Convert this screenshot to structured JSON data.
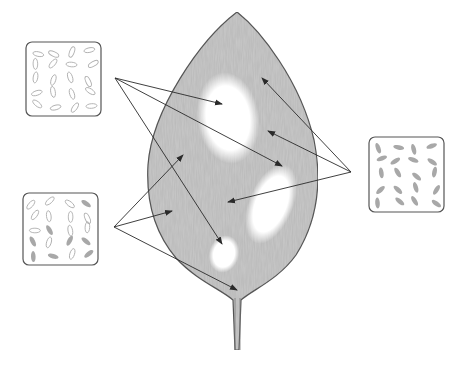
{
  "diagram": {
    "type": "variegated-leaf-illustration",
    "colors": {
      "leaf_fill": "#c9c9c9",
      "leaf_outline": "#5a5a5a",
      "white_patch": "#ffffff",
      "arrow": "#2a2a2a",
      "box_outline": "#555555",
      "chloroplast_pale_outline": "#b0b0b0",
      "chloroplast_green_fill": "#a8a8a8"
    },
    "leaf": {
      "tip": [
        237,
        12
      ],
      "base": [
        237,
        295
      ],
      "stalk_end": [
        237,
        350
      ],
      "white_patches": [
        {
          "name": "large-upper-patch",
          "cx": 228,
          "cy": 118,
          "rx": 30,
          "ry": 45
        },
        {
          "name": "right-patch",
          "cx": 270,
          "cy": 205,
          "rx": 22,
          "ry": 40
        },
        {
          "name": "small-lower-patch",
          "cx": 224,
          "cy": 254,
          "rx": 14,
          "ry": 18
        }
      ]
    },
    "inset_boxes": [
      {
        "name": "cells-white-region",
        "description": "cells with colourless (pale) plastids",
        "x": 26,
        "y": 42,
        "w": 75,
        "h": 74,
        "arrow_origin": [
          115,
          78
        ],
        "arrow_targets": [
          [
            222,
            104
          ],
          [
            282,
            166
          ],
          [
            222,
            244
          ]
        ]
      },
      {
        "name": "cells-mixed-region",
        "description": "cells with mixture of green and colourless plastids",
        "x": 23,
        "y": 193,
        "w": 75,
        "h": 72,
        "arrow_origin": [
          114,
          227
        ],
        "arrow_targets": [
          [
            183,
            155
          ],
          [
            172,
            211
          ],
          [
            237,
            290
          ]
        ]
      },
      {
        "name": "cells-green-region",
        "description": "cells with green chloroplasts",
        "x": 369,
        "y": 137,
        "w": 75,
        "h": 75,
        "arrow_origin": [
          351,
          172
        ],
        "arrow_targets": [
          [
            262,
            78
          ],
          [
            268,
            131
          ],
          [
            228,
            202
          ]
        ]
      }
    ]
  }
}
